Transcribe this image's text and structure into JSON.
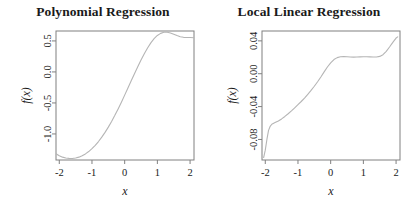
{
  "figure": {
    "background": "#ffffff",
    "line_color": "#b5b5b5",
    "axis_color": "#808080",
    "text_color": "#1a1a1a"
  },
  "chart_data": [
    {
      "type": "line",
      "title": "Polynomial Regression",
      "xlabel": "x",
      "ylabel": "f(x)",
      "xlim": [
        -2.1,
        2.12
      ],
      "ylim": [
        -1.42,
        0.66
      ],
      "xticks": [
        -2,
        -1,
        0,
        1,
        2
      ],
      "xticklabels": [
        "-2",
        "-1",
        "0",
        "1",
        "2"
      ],
      "yticks": [
        0.5,
        0.0,
        -0.5,
        -1.0
      ],
      "yticklabels": [
        "0.5",
        "0.0",
        "-0.5",
        "-1.0"
      ],
      "grid": false,
      "legend": null,
      "series": [
        {
          "name": "polynomial fit",
          "x": [
            -2.1,
            -2.0,
            -1.9,
            -1.8,
            -1.7,
            -1.6,
            -1.5,
            -1.4,
            -1.3,
            -1.2,
            -1.1,
            -1.0,
            -0.9,
            -0.8,
            -0.7,
            -0.6,
            -0.5,
            -0.4,
            -0.3,
            -0.2,
            -0.1,
            0.0,
            0.1,
            0.2,
            0.3,
            0.4,
            0.5,
            0.6,
            0.7,
            0.8,
            0.9,
            1.0,
            1.1,
            1.2,
            1.3,
            1.4,
            1.5,
            1.6,
            1.7,
            1.8,
            1.9,
            2.0,
            2.12
          ],
          "y": [
            -1.32,
            -1.352,
            -1.374,
            -1.388,
            -1.394,
            -1.395,
            -1.388,
            -1.374,
            -1.352,
            -1.322,
            -1.284,
            -1.238,
            -1.184,
            -1.122,
            -1.052,
            -0.975,
            -0.89,
            -0.798,
            -0.7,
            -0.596,
            -0.487,
            -0.374,
            -0.259,
            -0.143,
            -0.028,
            0.084,
            0.192,
            0.293,
            0.386,
            0.468,
            0.536,
            0.588,
            0.622,
            0.64,
            0.64,
            0.628,
            0.608,
            0.586,
            0.568,
            0.558,
            0.556,
            0.556,
            0.552
          ]
        }
      ]
    },
    {
      "type": "line",
      "title": "Local Linear Regression",
      "xlabel": "x",
      "ylabel": "f(x)",
      "xlim": [
        -2.1,
        2.12
      ],
      "ylim": [
        -0.105,
        0.052
      ],
      "xticks": [
        -2,
        -1,
        0,
        1,
        2
      ],
      "xticklabels": [
        "-2",
        "-1",
        "0",
        "1",
        "2"
      ],
      "yticks": [
        0.04,
        0.0,
        -0.04,
        -0.08
      ],
      "yticklabels": [
        "0.04",
        "0.00",
        "-0.04",
        "-0.08"
      ],
      "grid": false,
      "legend": null,
      "series": [
        {
          "name": "local linear fit",
          "x": [
            -2.05,
            -2.0,
            -1.95,
            -1.9,
            -1.85,
            -1.8,
            -1.7,
            -1.6,
            -1.5,
            -1.4,
            -1.3,
            -1.2,
            -1.1,
            -1.0,
            -0.9,
            -0.8,
            -0.7,
            -0.6,
            -0.5,
            -0.4,
            -0.3,
            -0.2,
            -0.1,
            0.0,
            0.1,
            0.2,
            0.3,
            0.4,
            0.5,
            0.6,
            0.7,
            0.8,
            0.9,
            1.0,
            1.1,
            1.2,
            1.3,
            1.4,
            1.5,
            1.6,
            1.7,
            1.8,
            1.9,
            2.0,
            2.05
          ],
          "y": [
            -0.102,
            -0.093,
            -0.08,
            -0.069,
            -0.064,
            -0.0615,
            -0.0595,
            -0.0575,
            -0.055,
            -0.052,
            -0.0487,
            -0.0452,
            -0.0415,
            -0.0377,
            -0.0338,
            -0.0296,
            -0.025,
            -0.0203,
            -0.0152,
            -0.0098,
            -0.004,
            0.0022,
            0.0082,
            0.0133,
            0.0172,
            0.0196,
            0.0206,
            0.0208,
            0.0206,
            0.0203,
            0.0202,
            0.0203,
            0.0205,
            0.0207,
            0.0207,
            0.0205,
            0.0203,
            0.0204,
            0.0211,
            0.0232,
            0.0272,
            0.0325,
            0.0382,
            0.0434,
            0.0448
          ]
        }
      ]
    }
  ]
}
